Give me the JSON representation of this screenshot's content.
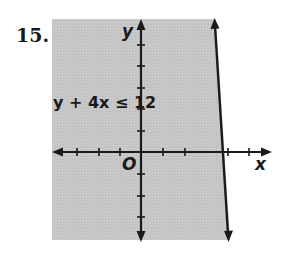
{
  "problem": {
    "number": "15."
  },
  "graph": {
    "inequality_label": "y + 4x ≤ 12",
    "x_axis_label": "x",
    "y_axis_label": "y",
    "origin_label": "O",
    "shade_color": "#c8c8c8",
    "line_color": "#1a1a1a",
    "boundary": {
      "type": "solid",
      "equation": "y = -4x + 12",
      "x_intercept": 3,
      "y_intercept": 12
    },
    "shaded_side": "left/below boundary line"
  }
}
